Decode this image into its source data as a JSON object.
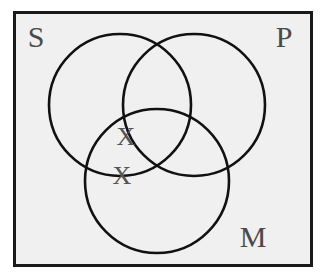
{
  "figure": {
    "type": "venn-diagram",
    "background_color": "#ffffff",
    "panel_fill": "#f0f0f0",
    "border_color": "#1a1a1a",
    "stroke_color": "#111111",
    "label_color": "#4a4a4a",
    "mark_color": "#555555"
  },
  "frame": {
    "x": 13,
    "y": 11,
    "width": 300,
    "height": 256,
    "stroke_width": 3
  },
  "circles": [
    {
      "name": "S",
      "cx": 120,
      "cy": 105,
      "r": 71
    },
    {
      "name": "P",
      "cx": 194,
      "cy": 105,
      "r": 71
    },
    {
      "name": "M",
      "cx": 157,
      "cy": 181,
      "r": 72
    }
  ],
  "labels": [
    {
      "id": "label-s",
      "text": "S",
      "x": 36,
      "y": 40
    },
    {
      "id": "label-p",
      "text": "P",
      "x": 284,
      "y": 40
    },
    {
      "id": "label-m",
      "text": "M",
      "x": 253,
      "y": 240
    }
  ],
  "marks": [
    {
      "id": "x-mark-upper",
      "text": "X",
      "x": 126,
      "y": 139
    },
    {
      "id": "x-mark-lower",
      "text": "X",
      "x": 122,
      "y": 178
    }
  ],
  "chart_data": {
    "type": "diagram",
    "subtype": "venn",
    "sets": [
      "S",
      "P",
      "M"
    ],
    "set_labels": {
      "S": "S",
      "P": "P",
      "M": "M"
    },
    "marks": [
      {
        "symbol": "X",
        "region": "S-and-M-not-P"
      },
      {
        "symbol": "X",
        "region": "S-and-M-not-P"
      }
    ],
    "shaded_regions": [],
    "legend": "none",
    "grid": false
  }
}
